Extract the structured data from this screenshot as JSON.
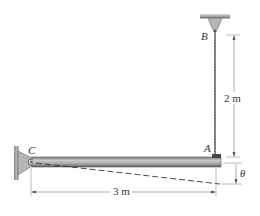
{
  "diagram": {
    "labels": {
      "point_b": "B",
      "point_a": "A",
      "point_c": "C",
      "angle": "θ"
    },
    "dimensions": {
      "vertical": "2 m",
      "horizontal": "3 m"
    },
    "colors": {
      "beam_fill": "#a9aaa8",
      "beam_dark": "#5f605e",
      "support": "#8c8d8b",
      "wire": "#555555",
      "dim_line": "#666666"
    }
  }
}
